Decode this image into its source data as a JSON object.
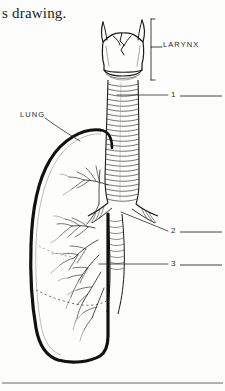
{
  "page": {
    "width": 225,
    "height": 391,
    "background_color": "#fdfdfc",
    "ink_color": "#1b1b1b"
  },
  "caption": {
    "text": "s drawing."
  },
  "figure": {
    "style": "line-art-engraving"
  },
  "annotations": {
    "larynx": {
      "label": "LARYNX",
      "marker": "bracket"
    },
    "lung": {
      "label": "LUNG",
      "marker": "leader-line"
    }
  },
  "numbered_blanks": [
    {
      "number": "1",
      "answer": ""
    },
    {
      "number": "2",
      "answer": ""
    },
    {
      "number": "3",
      "answer": ""
    }
  ],
  "colors": {
    "ink": "#1b1b1b",
    "hairline": "#4a4a4a",
    "paper": "#fdfdfc",
    "rule": "#555555"
  }
}
